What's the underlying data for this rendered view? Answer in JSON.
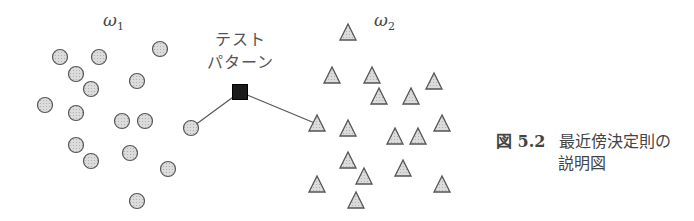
{
  "class1": {
    "label": "ω",
    "subscript": "1",
    "marker": "circle",
    "points": [
      [
        60,
        57
      ],
      [
        99,
        57
      ],
      [
        160,
        49
      ],
      [
        76,
        74
      ],
      [
        91,
        89
      ],
      [
        137,
        81
      ],
      [
        45,
        105
      ],
      [
        76,
        113
      ],
      [
        122,
        121
      ],
      [
        145,
        121
      ],
      [
        76,
        145
      ],
      [
        91,
        161
      ],
      [
        130,
        153
      ],
      [
        168,
        169
      ],
      [
        137,
        201
      ],
      [
        191,
        128
      ]
    ]
  },
  "class2": {
    "label": "ω",
    "subscript": "2",
    "marker": "triangle",
    "points": [
      [
        348,
        33
      ],
      [
        332,
        76
      ],
      [
        372,
        76
      ],
      [
        434,
        82
      ],
      [
        379,
        97
      ],
      [
        411,
        97
      ],
      [
        317,
        124
      ],
      [
        348,
        129
      ],
      [
        395,
        137
      ],
      [
        418,
        137
      ],
      [
        442,
        124
      ],
      [
        348,
        161
      ],
      [
        364,
        177
      ],
      [
        403,
        169
      ],
      [
        317,
        185
      ],
      [
        356,
        201
      ],
      [
        442,
        185
      ]
    ]
  },
  "test_pattern": {
    "line1": "テスト",
    "line2": "パターン",
    "position": [
      240,
      92
    ],
    "nearest_links": [
      [
        191,
        128
      ],
      [
        317,
        124
      ]
    ]
  },
  "caption": {
    "number": "図 5.2",
    "line1": "最近傍決定則の",
    "line2": "説明図"
  },
  "colors": {
    "marker_fill": "#d4d4d4",
    "marker_stroke": "#555555",
    "test_fill": "#1a1a1a",
    "line": "#555555"
  }
}
